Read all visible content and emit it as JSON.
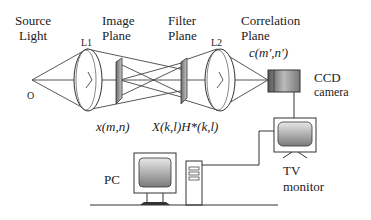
{
  "diagram": {
    "labels": {
      "source_light_line1": "Source",
      "source_light_line2": "Light",
      "image_plane_line1": "Image",
      "image_plane_line2": "Plane",
      "filter_plane_line1": "Filter",
      "filter_plane_line2": "Plane",
      "correlation_plane_line1": "Correlation",
      "correlation_plane_line2": "Plane",
      "lens1": "L1",
      "lens2": "L2",
      "origin": "O",
      "correlation_output": "c(m',n')",
      "image_function": "x(m,n)",
      "filter_function": "X(k,l)H*(k,l)",
      "ccd_line1": "CCD",
      "ccd_line2": "camera",
      "pc": "PC",
      "tv_line1": "TV",
      "tv_line2": "monitor"
    },
    "colors": {
      "stroke": "#333333",
      "plane_fill": "#a8a8a8",
      "background": "#ffffff"
    }
  }
}
